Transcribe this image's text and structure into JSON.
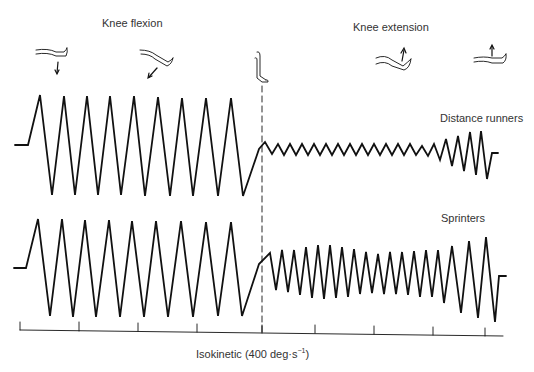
{
  "header": {
    "left_title": "Knee flexion",
    "right_title": "Knee extension"
  },
  "traces": [
    {
      "label": "Distance runners"
    },
    {
      "label": "Sprinters"
    }
  ],
  "axis": {
    "label": "Isokinetic (400 deg·s",
    "superscript": "−1",
    "close": ")",
    "tick_count": 9
  },
  "icons": [
    "leg-extended-down-arrow-icon",
    "leg-bent-down-arrow-icon",
    "leg-vertical-icon",
    "leg-bent-up-arrow-icon",
    "leg-extended-up-arrow-icon"
  ],
  "colors": {
    "line": "#111111",
    "text": "#333333",
    "background": "#ffffff"
  }
}
